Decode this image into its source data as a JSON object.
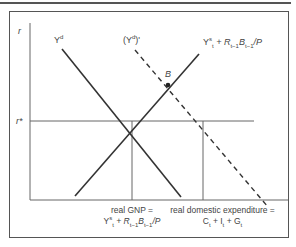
{
  "diagram": {
    "axis": {
      "y_label": "r",
      "r_star_label": "r*"
    },
    "curves": {
      "demand": {
        "label_base": "Y",
        "label_sup": "d"
      },
      "demand_shifted": {
        "label_base": "(Y",
        "label_sup": "d",
        "label_tail": ")'"
      },
      "supply": {
        "label_base": "Y",
        "label_sup": "s",
        "label_sub": "t",
        "label_plus": " + R",
        "label_sub2": "t−1",
        "label_b": "B",
        "label_sub3": "t−1",
        "label_tail": "/P"
      }
    },
    "point_b": "B",
    "captions": {
      "gnp_line1": "real GNP =",
      "gnp_line2_base": "Y",
      "gnp_line2_sup": "s",
      "gnp_line2_sub": "t",
      "gnp_line2_plus": " + R",
      "gnp_line2_sub2": "t−1",
      "gnp_line2_b": "B",
      "gnp_line2_sub3": "t−1",
      "gnp_line2_tail": "/P",
      "exp_line1": "real domestic expenditure =",
      "exp_c": "C",
      "exp_c_sub": "t",
      "exp_plus1": " + I",
      "exp_i_sub": "t",
      "exp_plus2": " + G",
      "exp_g_sub": "t"
    },
    "colors": {
      "line": "#333333",
      "axis": "#666666",
      "text": "#444444"
    }
  }
}
